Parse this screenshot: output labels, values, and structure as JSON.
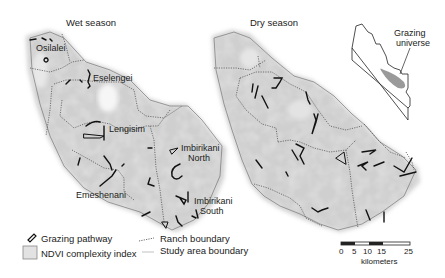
{
  "panels": {
    "wet": {
      "title": "Wet season",
      "ranches": [
        {
          "name": "Osilalei"
        },
        {
          "name": "Eselengei"
        },
        {
          "name": "Lengisim"
        },
        {
          "name": "Imbirikani",
          "line2": "North"
        },
        {
          "name": "Emeshenani"
        },
        {
          "name": "Imbirikani",
          "line2": "South"
        }
      ]
    },
    "dry": {
      "title": "Dry season"
    },
    "inset": {
      "label_line1": "Grazing",
      "label_line2": "universe"
    }
  },
  "legend": {
    "items": [
      {
        "icon": "grazing-pathway-icon",
        "label": "Grazing pathway"
      },
      {
        "icon": "ndvi-swatch-icon",
        "label": "NDVI complexity index"
      },
      {
        "icon": "ranch-boundary-line-icon",
        "label": "Ranch boundary"
      },
      {
        "icon": "study-area-boundary-line-icon",
        "label": "Study area boundary"
      }
    ]
  },
  "scale_bar": {
    "ticks": [
      "0",
      "5",
      "10",
      "15",
      "25"
    ],
    "unit": "kilometers"
  },
  "colors": {
    "ndvi_fill": "#c9c9c9",
    "ndvi_light": "#e6e6e6",
    "pathway": "#111111",
    "boundary": "#555555",
    "inset_area": "#9a9a9a"
  }
}
